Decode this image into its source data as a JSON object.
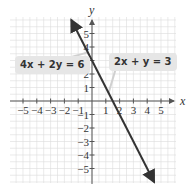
{
  "chart_data": {
    "type": "line",
    "title": "",
    "xlabel": "x",
    "ylabel": "y",
    "xlim": [
      -5.5,
      5.5
    ],
    "ylim": [
      -6,
      6
    ],
    "grid": true,
    "x_ticks": [
      -5,
      -4,
      -3,
      -2,
      -1,
      1,
      2,
      3,
      4,
      5
    ],
    "y_ticks": [
      -5,
      -4,
      -3,
      -2,
      -1,
      1,
      2,
      3,
      4,
      5
    ],
    "x_tick_labels": [
      "−5",
      "−4",
      "−3",
      "−2",
      "−1",
      "1",
      "2",
      "3",
      "4",
      "5"
    ],
    "y_tick_labels": [
      "−5",
      "−4",
      "−3",
      "−2",
      "−1",
      "1",
      "2",
      "3",
      "4",
      "5"
    ],
    "series": [
      {
        "name": "2x + y = 3 / 4x + 2y = 6 (same line)",
        "equation": "y = -2x + 3",
        "x": [
          -1.5,
          0,
          1.5,
          4.5
        ],
        "y": [
          6,
          3,
          0,
          -6
        ],
        "color": "#333333",
        "arrows": "both"
      }
    ],
    "annotations": [
      {
        "text": "4x + 2y = 6",
        "position": "left",
        "points_to": [
          -0.3,
          3.6
        ]
      },
      {
        "text": "2x + y = 3",
        "position": "right",
        "points_to": [
          1.2,
          0.6
        ]
      }
    ]
  },
  "labels": {
    "x_axis": "x",
    "y_axis": "y",
    "eq_left": "4x + 2y = 6",
    "eq_right": "2x + y = 3"
  },
  "colors": {
    "line": "#333333",
    "grid": "#dcdcdc",
    "axis": "#555555",
    "callout_bg": "#e6e6e6"
  }
}
